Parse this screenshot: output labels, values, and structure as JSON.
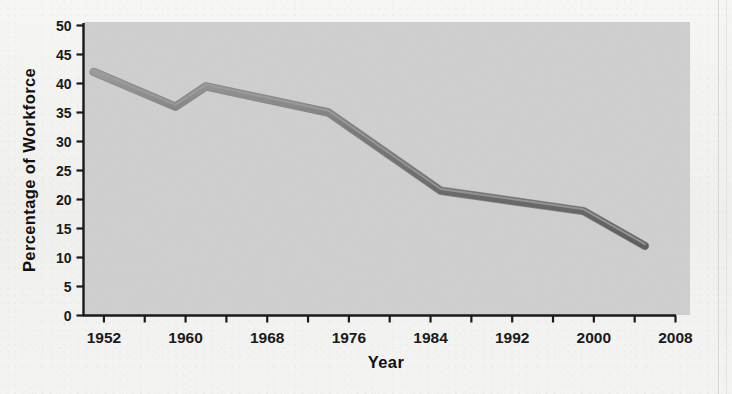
{
  "figure": {
    "background_color": "#f2f2f0",
    "plot_area_color": "#cfcfcf",
    "axis_color": "#1a1a1a",
    "line_color": "#6e6e6e",
    "line_highlight_color": "#8c8c8c"
  },
  "chart_data": {
    "type": "line",
    "title": "",
    "xlabel": "Year",
    "ylabel": "Percentage of  Workforce",
    "xlim": [
      1950,
      2008
    ],
    "ylim": [
      0,
      50
    ],
    "grid": false,
    "legend": null,
    "x_major_ticks": [
      1952,
      1960,
      1968,
      1976,
      1984,
      1992,
      2000,
      2008
    ],
    "x_minor_ticks": [
      1956,
      1964,
      1972,
      1980,
      1988,
      1996,
      2004
    ],
    "x_tick_labels": [
      "1952",
      "1960",
      "1968",
      "1976",
      "1984",
      "1992",
      "2000",
      "2008"
    ],
    "y_ticks": [
      0,
      5,
      10,
      15,
      20,
      25,
      30,
      35,
      40,
      45,
      50
    ],
    "y_tick_labels": [
      "0",
      "5",
      "10",
      "15",
      "20",
      "25",
      "30",
      "35",
      "40",
      "45",
      "50"
    ],
    "series": [
      {
        "name": "Percentage of Workforce",
        "x": [
          1951,
          1959,
          1962,
          1974,
          1985,
          1999,
          2005
        ],
        "values": [
          42,
          36,
          39.5,
          35,
          21.5,
          18,
          12
        ]
      }
    ]
  }
}
